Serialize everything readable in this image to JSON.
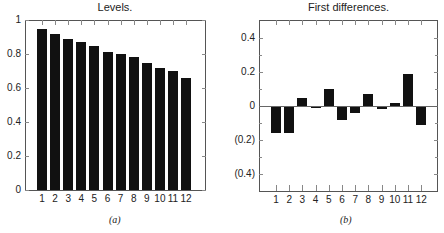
{
  "figure": {
    "captions": [
      "(a)",
      "(b)"
    ]
  },
  "chart_data": [
    {
      "type": "bar",
      "title": "Levels.",
      "xlabel": "",
      "ylabel": "",
      "categories": [
        "1",
        "2",
        "3",
        "4",
        "5",
        "6",
        "7",
        "8",
        "9",
        "10",
        "11",
        "12"
      ],
      "values": [
        0.95,
        0.92,
        0.89,
        0.87,
        0.85,
        0.81,
        0.8,
        0.78,
        0.75,
        0.72,
        0.7,
        0.66
      ],
      "ylim": [
        0,
        1
      ],
      "yticks": [
        0,
        0.2,
        0.4,
        0.6,
        0.8,
        1
      ],
      "ytick_labels": [
        "0",
        "0.2",
        "0.4",
        "0.6",
        "0.8",
        "1"
      ],
      "grid": false,
      "caption": "(a)"
    },
    {
      "type": "bar",
      "title": "First differences.",
      "xlabel": "",
      "ylabel": "",
      "categories": [
        "1",
        "2",
        "3",
        "4",
        "5",
        "6",
        "7",
        "8",
        "9",
        "10",
        "11",
        "12"
      ],
      "values": [
        -0.16,
        -0.16,
        0.05,
        -0.01,
        0.1,
        -0.08,
        -0.04,
        0.07,
        -0.02,
        0.02,
        0.19,
        -0.11
      ],
      "ylim": [
        -0.5,
        0.5
      ],
      "yticks": [
        0.4,
        0.2,
        0,
        -0.2,
        -0.4
      ],
      "ytick_labels": [
        "0.4",
        "0.2",
        "0",
        "(0.2)",
        "(0.4)"
      ],
      "grid": false,
      "caption": "(b)"
    }
  ]
}
